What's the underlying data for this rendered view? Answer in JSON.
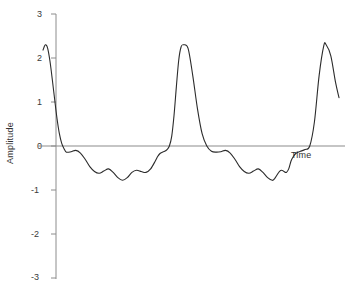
{
  "chart_data": {
    "type": "line",
    "title": "",
    "xlabel": "Time",
    "ylabel": "Amplitude",
    "ylim": [
      -3,
      3
    ],
    "yticks": [
      3,
      2,
      1,
      0,
      -1,
      -2,
      -3
    ],
    "ytick_labels": [
      "3",
      "2",
      "1",
      "0",
      "-1",
      "-2",
      "-3"
    ],
    "xticks": [],
    "xtick_labels": [],
    "grid": false,
    "legend": null,
    "axis_style": {
      "y_axis": "vertical line with outward ticks at left",
      "x_axis": "horizontal zero line extending to right edge",
      "x_axis_value": 0
    },
    "line_color": "#2b2b2b",
    "line_width": 1,
    "zero_line_color": "#8c8c8c",
    "axis_color": "#8c8c8c",
    "period_units": 1.0,
    "series": [
      {
        "name": "signal",
        "x": [
          0.0,
          0.02,
          0.04,
          0.06,
          0.08,
          0.1,
          0.12,
          0.14,
          0.16,
          0.18,
          0.2,
          0.24,
          0.28,
          0.32,
          0.36,
          0.4,
          0.44,
          0.48,
          0.52,
          0.56,
          0.6,
          0.64,
          0.68,
          0.72,
          0.76,
          0.8,
          0.84,
          0.88,
          0.92,
          0.96,
          0.98,
          1.0,
          1.02,
          1.04,
          1.06,
          1.08,
          1.1,
          1.12,
          1.14,
          1.16,
          1.18,
          1.2,
          1.24,
          1.28,
          1.32,
          1.36,
          1.4,
          1.44,
          1.48,
          1.52,
          1.56,
          1.6,
          1.64,
          1.68,
          1.72,
          1.76,
          1.8,
          1.84,
          1.88,
          1.92,
          1.96,
          1.98,
          2.0,
          2.02,
          2.04,
          2.06,
          2.08,
          2.1,
          2.12,
          2.14,
          2.16,
          2.18,
          2.2
        ],
        "y": [
          2.18,
          2.3,
          2.22,
          1.92,
          1.5,
          1.05,
          0.62,
          0.28,
          0.06,
          -0.06,
          -0.14,
          -0.13,
          -0.1,
          -0.16,
          -0.3,
          -0.47,
          -0.58,
          -0.62,
          -0.57,
          -0.52,
          -0.6,
          -0.72,
          -0.78,
          -0.72,
          -0.6,
          -0.55,
          -0.58,
          -0.6,
          -0.52,
          -0.34,
          -0.24,
          -0.17,
          -0.14,
          -0.12,
          -0.08,
          0.0,
          0.22,
          0.7,
          1.35,
          1.95,
          2.25,
          2.3,
          2.22,
          1.6,
          0.85,
          0.28,
          0.0,
          -0.12,
          -0.14,
          -0.13,
          -0.1,
          -0.16,
          -0.3,
          -0.47,
          -0.58,
          -0.62,
          -0.57,
          -0.52,
          -0.6,
          -0.72,
          -0.78,
          -0.74,
          -0.66,
          -0.58,
          -0.55,
          -0.58,
          -0.6,
          -0.52,
          -0.34,
          -0.24,
          -0.17,
          -0.14,
          -0.12
        ],
        "note": "continues: rises to third spike peak 2.30 then truncated at about 1.10"
      }
    ],
    "truncation": {
      "end_value": 1.1,
      "note": "trace stops abruptly on the falling edge of the third spike"
    }
  }
}
